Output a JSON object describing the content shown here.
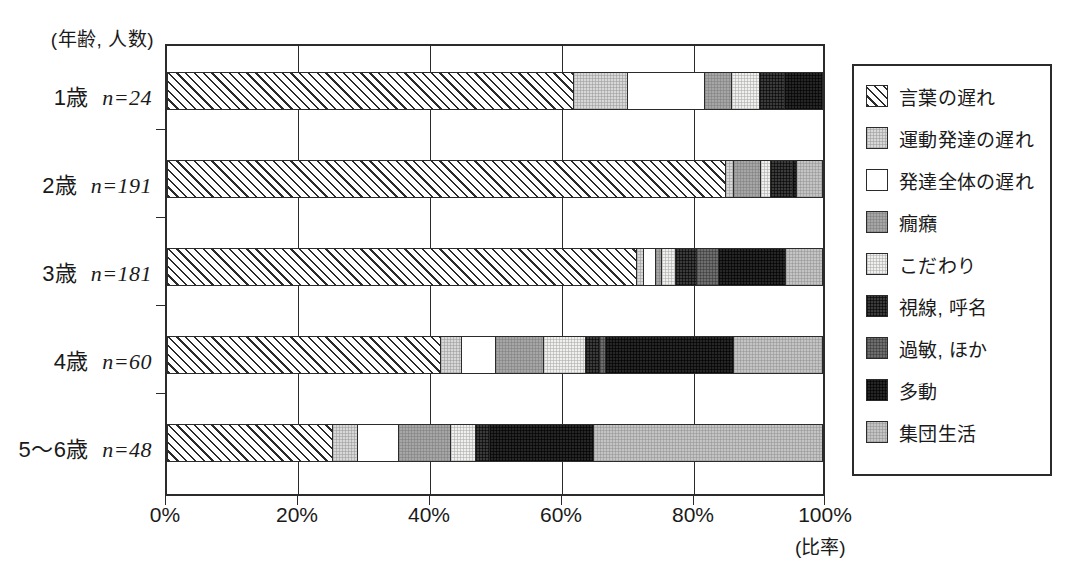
{
  "chart_data": {
    "type": "bar",
    "orientation": "horizontal",
    "stacked": true,
    "normalized": "100%",
    "title": "",
    "xlabel": "(比率)",
    "ylabel": "(年齢, 人数)",
    "xlim": [
      0,
      100
    ],
    "xticks": [
      0,
      20,
      40,
      60,
      80,
      100
    ],
    "xticklabels": [
      "0%",
      "20%",
      "40%",
      "60%",
      "80%",
      "100%"
    ],
    "grid": true,
    "legend_position": "right",
    "categories": [
      {
        "age": "1歳",
        "n_label": "n=24",
        "n": 24
      },
      {
        "age": "2歳",
        "n_label": "n=191",
        "n": 191
      },
      {
        "age": "3歳",
        "n_label": "n=181",
        "n": 181
      },
      {
        "age": "4歳",
        "n_label": "n=60",
        "n": 60
      },
      {
        "age": "5〜6歳",
        "n_label": "n=48",
        "n": 48
      }
    ],
    "series": [
      {
        "name": "言葉の遅れ",
        "fill": "hatch",
        "values": [
          62.1,
          85.3,
          71.7,
          41.7,
          25.2
        ]
      },
      {
        "name": "運動発達の遅れ",
        "fill": "lgray",
        "values": [
          8.3,
          1.2,
          1.1,
          3.2,
          3.9
        ]
      },
      {
        "name": "発達全体の遅れ",
        "fill": "white",
        "values": [
          11.7,
          0.0,
          1.8,
          5.3,
          6.2
        ]
      },
      {
        "name": "癇癪",
        "fill": "mgray",
        "values": [
          4.2,
          4.2,
          0.9,
          7.3,
          8.0
        ]
      },
      {
        "name": "こだわり",
        "fill": "xlight",
        "values": [
          4.2,
          1.5,
          2.1,
          6.4,
          3.8
        ]
      },
      {
        "name": "視線, 呼名",
        "fill": "vdark",
        "values": [
          3.9,
          3.3,
          3.3,
          2.1,
          2.2
        ]
      },
      {
        "name": "過敏, ほか",
        "fill": "dgray",
        "values": [
          0.0,
          0.0,
          3.3,
          0.9,
          0.0
        ]
      },
      {
        "name": "多動",
        "fill": "black",
        "values": [
          5.6,
          0.7,
          10.3,
          19.7,
          15.9
        ]
      },
      {
        "name": "集団生活",
        "fill": "gray2",
        "values": [
          0.0,
          3.8,
          5.5,
          13.4,
          34.8
        ]
      }
    ]
  },
  "legend": {
    "items": [
      {
        "label": "言葉の遅れ",
        "swatch": "hatch-swatch"
      },
      {
        "label": "運動発達の遅れ",
        "swatch": "lgray-swatch"
      },
      {
        "label": "発達全体の遅れ",
        "swatch": "white-swatch"
      },
      {
        "label": "癇癪",
        "swatch": "mgray-swatch"
      },
      {
        "label": "こだわり",
        "swatch": "xlight-swatch"
      },
      {
        "label": "視線, 呼名",
        "swatch": "vdark-swatch"
      },
      {
        "label": "過敏, ほか",
        "swatch": "dgray-swatch"
      },
      {
        "label": "多動",
        "swatch": "black-swatch"
      },
      {
        "label": "集団生活",
        "swatch": "gray2-swatch"
      }
    ]
  },
  "axes": {
    "y_caption": "(年齢, 人数)",
    "x_unit": "(比率)",
    "cat_labels": [
      "1歳  n=24",
      "2歳  n=191",
      "3歳  n=181",
      "4歳  n=60",
      "5〜6歳  n=48"
    ],
    "cat_age": [
      "1歳",
      "2歳",
      "3歳",
      "4歳",
      "5〜6歳"
    ],
    "cat_n": [
      "n=24",
      "n=191",
      "n=181",
      "n=60",
      "n=48"
    ],
    "xticklabels": [
      "0%",
      "20%",
      "40%",
      "60%",
      "80%",
      "100%"
    ]
  },
  "colors": {
    "frame": "#2b2b2b",
    "background": "#ffffff",
    "lgray": "#d8d8d8",
    "mgray": "#a6a6a6",
    "xlight": "#f0f0ee",
    "vdark": "#3b3b3b",
    "dgray": "#6e6e6e",
    "black": "#262626",
    "gray2": "#c4c4c4"
  }
}
